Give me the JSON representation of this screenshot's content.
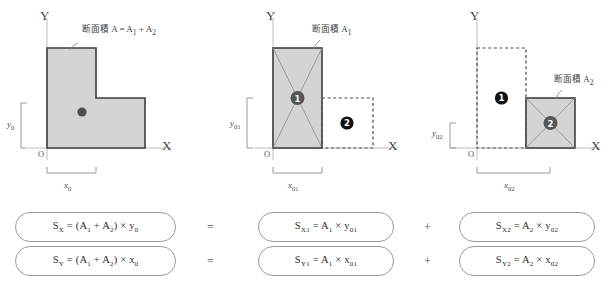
{
  "diagram": {
    "title_note": "Cross-sectional area decomposition for first moment of area",
    "axis": {
      "x_label": "X",
      "y_label": "Y",
      "origin_label": "O"
    },
    "colors": {
      "fill_gray": "#d4d4d4",
      "outline_dark": "#3f3f3f",
      "dashed_gray": "#5a5a5a",
      "axis_gray": "#b8b8b8",
      "marker_one": "#555555",
      "marker_two": "#1a1a1a",
      "pill_border": "#9a9a9a",
      "text": "#333333"
    },
    "panels": [
      {
        "id": "panel-combined",
        "callout": "断面積 A = A1 + A2",
        "callout_cjk": "断面積",
        "callout_math": "A = A1 + A2",
        "dim_x": "x0",
        "dim_y": "y0",
        "markers": [],
        "centroid_dot": true
      },
      {
        "id": "panel-a1",
        "callout": "断面積 A1",
        "callout_cjk": "断面積",
        "callout_math": "A1",
        "dim_x": "x01",
        "dim_y": "y01",
        "markers": [
          {
            "label": "1",
            "style": "filled-gray"
          },
          {
            "label": "2",
            "style": "filled-black"
          }
        ]
      },
      {
        "id": "panel-a2",
        "callout": "断面積 A2",
        "callout_cjk": "断面積",
        "callout_math": "A2",
        "dim_x": "x02",
        "dim_y": "y02",
        "markers": [
          {
            "label": "1",
            "style": "filled-black"
          },
          {
            "label": "2",
            "style": "filled-gray"
          }
        ]
      }
    ],
    "formulas": {
      "row1": {
        "left": "Sx = (A1 + A2) × y0",
        "op1": "=",
        "middle": "Sx1 = A1 × y01",
        "op2": "+",
        "right": "Sx2 = A2 × y02"
      },
      "row2": {
        "left": "Sy = (A1 + A2) × x0",
        "op1": "=",
        "middle": "Sy1 = A1 × x01",
        "op2": "+",
        "right": "Sy2 = A2 × x02"
      }
    }
  }
}
